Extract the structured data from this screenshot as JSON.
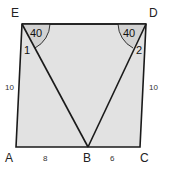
{
  "figure": {
    "colors": {
      "fill": "#e2e2e2",
      "arc_fill": "#d6d6d6",
      "stroke": "#1a1a1a"
    },
    "vertices": {
      "E": {
        "label": "E",
        "x": 22,
        "y": 24
      },
      "D": {
        "label": "D",
        "x": 146,
        "y": 24
      },
      "A": {
        "label": "A",
        "x": 16,
        "y": 147
      },
      "B": {
        "label": "B",
        "x": 88,
        "y": 147
      },
      "C": {
        "label": "C",
        "x": 140,
        "y": 147
      }
    },
    "angles": {
      "E_top": "40",
      "E_inner": "1",
      "D_top": "40",
      "D_inner": "2"
    },
    "sides": {
      "AE": "10",
      "CD": "10",
      "AB": "8",
      "BC": "6"
    }
  }
}
